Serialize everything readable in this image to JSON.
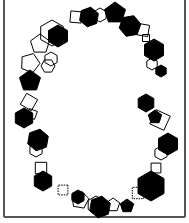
{
  "figure": {
    "frame": {
      "x1": 4,
      "y1": 0,
      "x2": 185,
      "y2": 217,
      "color": "#555555"
    },
    "colors": {
      "filled": "#000000",
      "outline": "#000000",
      "background": "#ffffff"
    },
    "shapes": [
      {
        "type": "square",
        "cx": 76,
        "cy": 17,
        "r": 8,
        "rot": 5,
        "fill": false
      },
      {
        "type": "hexagon",
        "cx": 89,
        "cy": 17,
        "r": 10,
        "rot": 10,
        "fill": true
      },
      {
        "type": "hexagon",
        "cx": 100,
        "cy": 15,
        "r": 7,
        "rot": 0,
        "fill": false
      },
      {
        "type": "pentagon",
        "cx": 115,
        "cy": 13,
        "r": 11,
        "rot": 0,
        "fill": true
      },
      {
        "type": "hexagon",
        "cx": 130,
        "cy": 26,
        "r": 11,
        "rot": 20,
        "fill": true
      },
      {
        "type": "square",
        "cx": 143,
        "cy": 30,
        "r": 8,
        "rot": 10,
        "fill": false
      },
      {
        "type": "square",
        "cx": 146,
        "cy": 38,
        "r": 5,
        "rot": 0,
        "fill": false
      },
      {
        "type": "hexagon",
        "cx": 154,
        "cy": 50,
        "r": 11,
        "rot": 0,
        "fill": true
      },
      {
        "type": "hexagon",
        "cx": 152,
        "cy": 64,
        "r": 6,
        "rot": 0,
        "fill": false
      },
      {
        "type": "hexagon",
        "cx": 161,
        "cy": 71,
        "r": 6,
        "rot": 0,
        "fill": true
      },
      {
        "type": "hexagon",
        "cx": 58,
        "cy": 36,
        "r": 11,
        "rot": 0,
        "fill": true
      },
      {
        "type": "hexagon",
        "cx": 52,
        "cy": 33,
        "r": 13,
        "rot": 0,
        "fill": false
      },
      {
        "type": "pentagon",
        "cx": 40,
        "cy": 44,
        "r": 10,
        "rot": 0,
        "fill": false
      },
      {
        "type": "hexagon",
        "cx": 51,
        "cy": 59,
        "r": 7,
        "rot": 0,
        "fill": false
      },
      {
        "type": "hexagon",
        "cx": 48,
        "cy": 66,
        "r": 7,
        "rot": 30,
        "fill": false
      },
      {
        "type": "pentagon",
        "cx": 30,
        "cy": 63,
        "r": 10,
        "rot": 20,
        "fill": false
      },
      {
        "type": "pentagon",
        "cx": 30,
        "cy": 81,
        "r": 11,
        "rot": 0,
        "fill": true
      },
      {
        "type": "square",
        "cx": 29,
        "cy": 102,
        "r": 9,
        "rot": 30,
        "fill": false
      },
      {
        "type": "hexagon",
        "cx": 24,
        "cy": 118,
        "r": 10,
        "rot": 0,
        "fill": true
      },
      {
        "type": "square",
        "cx": 32,
        "cy": 114,
        "r": 6,
        "rot": 20,
        "fill": false
      },
      {
        "type": "hexagon",
        "cx": 38,
        "cy": 140,
        "r": 11,
        "rot": 10,
        "fill": true
      },
      {
        "type": "hexagon",
        "cx": 36,
        "cy": 150,
        "r": 7,
        "rot": 0,
        "fill": false
      },
      {
        "type": "square",
        "cx": 41,
        "cy": 168,
        "r": 8,
        "rot": 0,
        "fill": false
      },
      {
        "type": "hexagon",
        "cx": 43,
        "cy": 181,
        "r": 10,
        "rot": 0,
        "fill": true
      },
      {
        "type": "square",
        "cx": 63,
        "cy": 190,
        "r": 7,
        "rot": 0,
        "fill": false,
        "dashed": true
      },
      {
        "type": "pentagon",
        "cx": 80,
        "cy": 200,
        "r": 9,
        "rot": 10,
        "fill": false
      },
      {
        "type": "hexagon",
        "cx": 78,
        "cy": 197,
        "r": 7,
        "rot": 0,
        "fill": true
      },
      {
        "type": "hexagon",
        "cx": 96,
        "cy": 205,
        "r": 9,
        "rot": 0,
        "fill": false
      },
      {
        "type": "hexagon",
        "cx": 100,
        "cy": 207,
        "r": 11,
        "rot": 10,
        "fill": true
      },
      {
        "type": "pentagon",
        "cx": 113,
        "cy": 205,
        "r": 7,
        "rot": 0,
        "fill": false
      },
      {
        "type": "pentagon",
        "cx": 127,
        "cy": 206,
        "r": 7,
        "rot": 0,
        "fill": true
      },
      {
        "type": "square",
        "cx": 138,
        "cy": 193,
        "r": 8,
        "rot": 0,
        "fill": false,
        "dashed": true
      },
      {
        "type": "hexagon",
        "cx": 151,
        "cy": 186,
        "r": 15,
        "rot": 0,
        "fill": true
      },
      {
        "type": "square",
        "cx": 156,
        "cy": 168,
        "r": 7,
        "rot": 0,
        "fill": false
      },
      {
        "type": "hexagon",
        "cx": 161,
        "cy": 153,
        "r": 7,
        "rot": 0,
        "fill": false
      },
      {
        "type": "hexagon",
        "cx": 168,
        "cy": 144,
        "r": 11,
        "rot": 0,
        "fill": true
      },
      {
        "type": "square",
        "cx": 160,
        "cy": 120,
        "r": 11,
        "rot": 25,
        "fill": false
      },
      {
        "type": "pentagon",
        "cx": 155,
        "cy": 117,
        "r": 7,
        "rot": 0,
        "fill": true
      },
      {
        "type": "hexagon",
        "cx": 146,
        "cy": 103,
        "r": 9,
        "rot": 0,
        "fill": true
      }
    ]
  }
}
